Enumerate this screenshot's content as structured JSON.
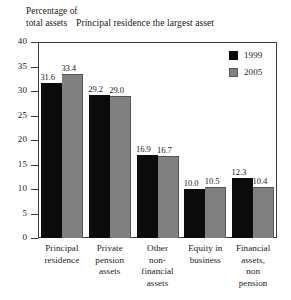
{
  "chart_data": {
    "type": "bar",
    "title": "Principal residence the largest asset",
    "xlabel": "",
    "ylabel": "Percentage of total assets",
    "ylabel_lines": [
      "Percentage of",
      "total assets"
    ],
    "categories": [
      "Principal residence",
      "Private pension assets",
      "Other non-financial assets",
      "Equity in business",
      "Financial assets, non pension"
    ],
    "category_lines": [
      [
        "Principal",
        "residence"
      ],
      [
        "Private",
        "pension",
        "assets"
      ],
      [
        "Other",
        "non-",
        "financial",
        "assets"
      ],
      [
        "Equity in",
        "business"
      ],
      [
        "Financial",
        "assets,",
        "non",
        "pension"
      ]
    ],
    "series": [
      {
        "name": "1999",
        "color": "#0b0b0b",
        "values": [
          31.6,
          29.2,
          16.9,
          10.0,
          12.3
        ]
      },
      {
        "name": "2005",
        "color": "#808080",
        "values": [
          33.4,
          29.0,
          16.7,
          10.5,
          10.4
        ]
      }
    ],
    "value_labels": [
      [
        "31.6",
        "33.4"
      ],
      [
        "29.2",
        "29.0"
      ],
      [
        "16.9",
        "16.7"
      ],
      [
        "10.0",
        "10.5"
      ],
      [
        "12.3",
        "10.4"
      ]
    ],
    "ylim": [
      0,
      40
    ],
    "yticks": [
      0,
      5,
      10,
      15,
      20,
      25,
      30,
      35,
      40
    ],
    "ytick_labels": [
      "0",
      "5",
      "10",
      "15",
      "20",
      "25",
      "30",
      "35",
      "40"
    ],
    "grid": false,
    "legend_position": "top-right"
  }
}
